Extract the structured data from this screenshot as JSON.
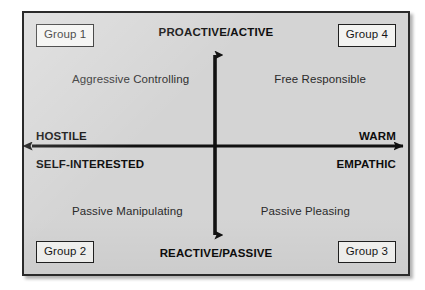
{
  "diagram": {
    "type": "two-by-two-quadrant-matrix",
    "background_color": "#d4d4d4",
    "frame_border_color": "#2a2a2a",
    "axes": {
      "vertical": {
        "orientation": "vertical",
        "double_headed": true,
        "color": "#111111",
        "top_label": "PROACTIVE/ACTIVE",
        "bottom_label": "REACTIVE/PASSIVE"
      },
      "horizontal": {
        "orientation": "horizontal",
        "double_headed": true,
        "color": "#111111",
        "left_label_upper": "HOSTILE",
        "left_label_lower": "SELF-INTERESTED",
        "right_label_upper": "WARM",
        "right_label_lower": "EMPATHIC"
      }
    },
    "corner_boxes": [
      {
        "id": "group-1",
        "label": "Group 1",
        "corner": "top-left"
      },
      {
        "id": "group-4",
        "label": "Group 4",
        "corner": "top-right"
      },
      {
        "id": "group-2",
        "label": "Group 2",
        "corner": "bottom-left"
      },
      {
        "id": "group-3",
        "label": "Group 3",
        "corner": "bottom-right"
      }
    ],
    "quadrants": [
      {
        "id": "q1",
        "position": "top-left",
        "label": "Aggressive Controlling",
        "group": "Group 1"
      },
      {
        "id": "q4",
        "position": "top-right",
        "label": "Free Responsible",
        "group": "Group 4"
      },
      {
        "id": "q2",
        "position": "bottom-left",
        "label": "Passive Manipulating",
        "group": "Group 2"
      },
      {
        "id": "q3",
        "position": "bottom-right",
        "label": "Passive Pleasing",
        "group": "Group 3"
      }
    ]
  }
}
